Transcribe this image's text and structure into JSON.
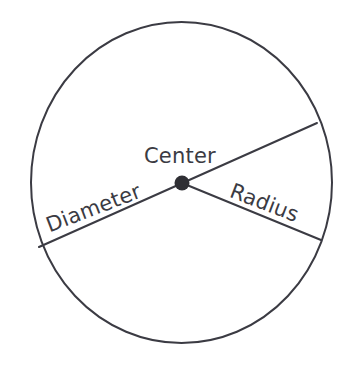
{
  "diagram": {
    "type": "geometry-circle-diagram",
    "colors": {
      "stroke": "#3b3b43",
      "text": "#3b3b43",
      "background": "#ffffff",
      "center_dot": "#2f2f34"
    },
    "circle": {
      "center_x": 181.5,
      "center_y": 182.5,
      "radius_x": 150.5,
      "radius_y": 160.5,
      "stroke_width": 2
    },
    "center_dot": {
      "x": 182,
      "y": 183,
      "radius": 7.5
    },
    "lines": [
      {
        "name": "diameter-line",
        "x1": 39,
        "y1": 247,
        "x2": 317,
        "y2": 123,
        "stroke_width": 2
      },
      {
        "name": "radius-line",
        "x1": 182,
        "y1": 183,
        "x2": 321,
        "y2": 240,
        "stroke_width": 2
      }
    ],
    "labels": {
      "center": "Center",
      "radius": "Radius",
      "diameter": "Diameter"
    }
  }
}
